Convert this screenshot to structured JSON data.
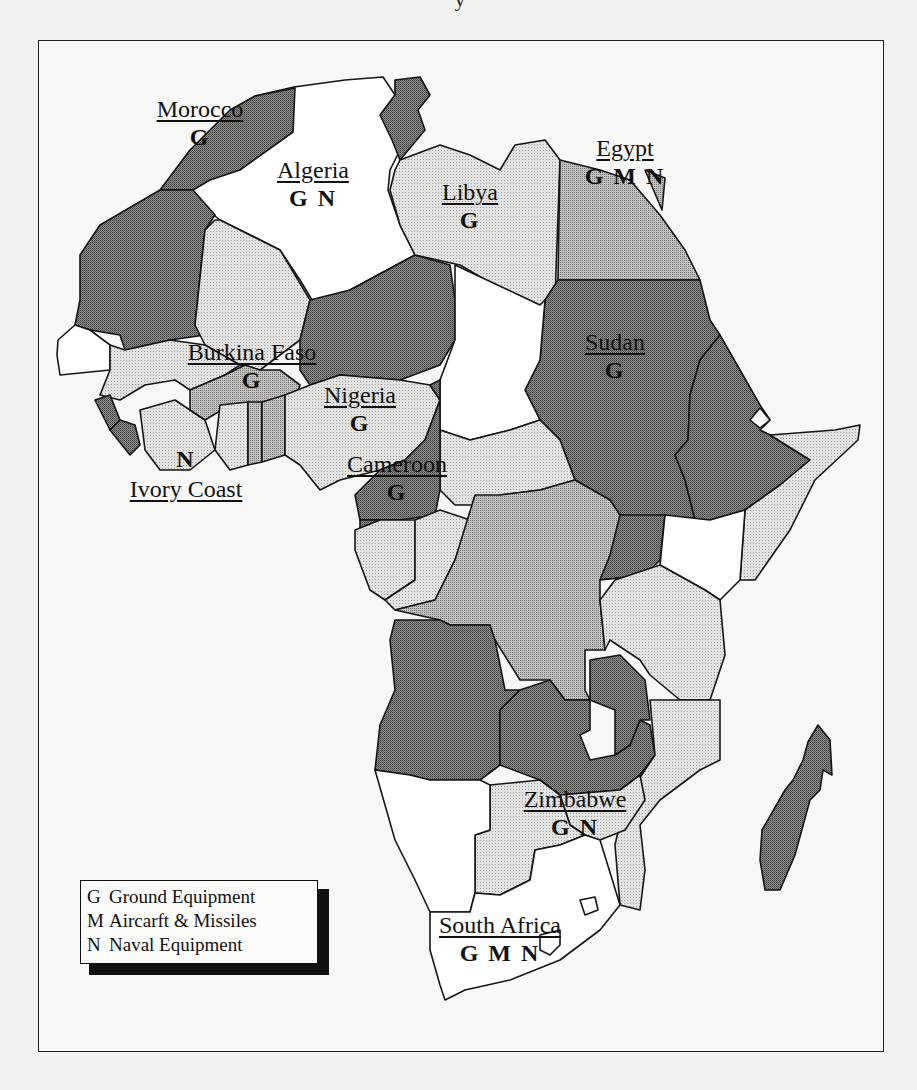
{
  "document": {
    "title_fragment": "y"
  },
  "map": {
    "region": "Africa",
    "shade_colors": {
      "white": "#ffffff",
      "light": "#d4d4d2",
      "medium": "#a9a9a7",
      "dark": "#7b7b79"
    },
    "countries": [
      {
        "name": "Morocco",
        "codes": "G"
      },
      {
        "name": "Algeria",
        "codes": "G N"
      },
      {
        "name": "Libya",
        "codes": "G"
      },
      {
        "name": "Egypt",
        "codes": "G M N"
      },
      {
        "name": "Sudan",
        "codes": "G"
      },
      {
        "name": "Burkina Faso",
        "codes": "G"
      },
      {
        "name": "Nigeria",
        "codes": "G"
      },
      {
        "name": "Cameroon",
        "codes": "G"
      },
      {
        "name": "Ivory Coast",
        "codes": "N"
      },
      {
        "name": "Zimbabwe",
        "codes": "G N"
      },
      {
        "name": "South Africa",
        "codes": "G M N"
      }
    ]
  },
  "legend": {
    "items": [
      {
        "key": "G",
        "label": "Ground Equipment"
      },
      {
        "key": "M",
        "label": "Aircarft & Missiles"
      },
      {
        "key": "N",
        "label": "Naval Equipment"
      }
    ]
  }
}
